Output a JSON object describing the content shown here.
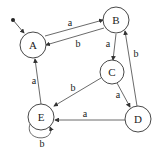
{
  "diagram": {
    "type": "state-machine",
    "states": [
      {
        "id": "A",
        "label": "A",
        "cx": 33,
        "cy": 45,
        "r": 13,
        "initial": true
      },
      {
        "id": "B",
        "label": "B",
        "cx": 116,
        "cy": 20,
        "r": 13
      },
      {
        "id": "C",
        "label": "C",
        "cx": 112,
        "cy": 72,
        "r": 12
      },
      {
        "id": "D",
        "label": "D",
        "cx": 138,
        "cy": 119,
        "r": 13
      },
      {
        "id": "E",
        "label": "E",
        "cx": 41,
        "cy": 117,
        "r": 13
      }
    ],
    "transitions": [
      {
        "from": "A",
        "to": "B",
        "label": "a"
      },
      {
        "from": "B",
        "to": "A",
        "label": "b"
      },
      {
        "from": "B",
        "to": "C",
        "label": "a"
      },
      {
        "from": "C",
        "to": "D",
        "label": "a"
      },
      {
        "from": "C",
        "to": "E",
        "label": "b"
      },
      {
        "from": "D",
        "to": "E",
        "label": "a"
      },
      {
        "from": "D",
        "to": "B",
        "label": "b"
      },
      {
        "from": "E",
        "to": "A",
        "label": "a"
      },
      {
        "from": "E",
        "to": "E",
        "label": "b"
      }
    ]
  },
  "labels": {
    "A": "A",
    "B": "B",
    "C": "C",
    "D": "D",
    "E": "E",
    "ab": "a",
    "ba": "b",
    "bc": "a",
    "cd": "a",
    "ce": "b",
    "de": "a",
    "db": "b",
    "ea": "a",
    "ee": "b"
  }
}
